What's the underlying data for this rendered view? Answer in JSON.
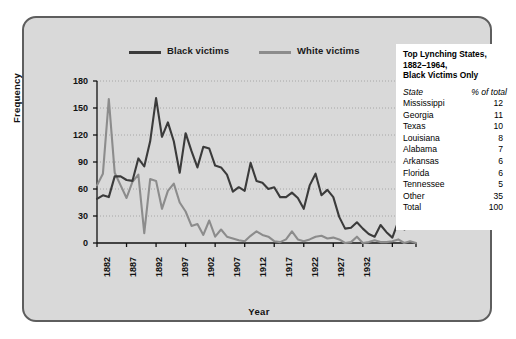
{
  "chart_data": {
    "type": "line",
    "title": "",
    "xlabel": "Year",
    "ylabel": "Frequency",
    "xlim": [
      1882,
      1936
    ],
    "ylim": [
      0,
      180
    ],
    "yticks": [
      0,
      30,
      60,
      90,
      120,
      150,
      180
    ],
    "xticks": [
      1882,
      1887,
      1892,
      1897,
      1902,
      1907,
      1912,
      1917,
      1922,
      1927,
      1932
    ],
    "grid": "horizontal-dotted",
    "legend_position": "top",
    "x": [
      1882,
      1883,
      1884,
      1885,
      1886,
      1887,
      1888,
      1889,
      1890,
      1891,
      1892,
      1893,
      1894,
      1895,
      1896,
      1897,
      1898,
      1899,
      1900,
      1901,
      1902,
      1903,
      1904,
      1905,
      1906,
      1907,
      1908,
      1909,
      1910,
      1911,
      1912,
      1913,
      1914,
      1915,
      1916,
      1917,
      1918,
      1919,
      1920,
      1921,
      1922,
      1923,
      1924,
      1925,
      1926,
      1927,
      1928,
      1929,
      1930,
      1931,
      1932,
      1933,
      1934,
      1935,
      1936
    ],
    "series": [
      {
        "name": "Black victims",
        "color": "#3b3b3b",
        "values": [
          49,
          53,
          51,
          74,
          74,
          70,
          69,
          94,
          85,
          113,
          161,
          118,
          134,
          113,
          78,
          122,
          102,
          84,
          107,
          105,
          86,
          84,
          76,
          57,
          62,
          58,
          89,
          69,
          67,
          60,
          62,
          51,
          51,
          56,
          50,
          38,
          64,
          77,
          53,
          59,
          51,
          29,
          16,
          17,
          23,
          16,
          10,
          7,
          20,
          12,
          6,
          24,
          15,
          18,
          18
        ]
      },
      {
        "name": "White victims",
        "color": "#8c8c8c",
        "values": [
          64,
          77,
          160,
          78,
          64,
          50,
          68,
          76,
          11,
          71,
          69,
          38,
          58,
          66,
          45,
          35,
          19,
          21,
          9,
          25,
          7,
          15,
          7,
          5,
          3,
          2,
          8,
          13,
          9,
          7,
          2,
          1,
          4,
          13,
          4,
          2,
          4,
          7,
          8,
          5,
          6,
          4,
          0,
          1,
          7,
          0,
          1,
          3,
          1,
          1,
          2,
          4,
          0,
          2,
          0
        ]
      }
    ]
  },
  "legend": {
    "items": [
      {
        "label": "Black victims",
        "color": "#3b3b3b"
      },
      {
        "label": "White victims",
        "color": "#8c8c8c"
      }
    ]
  },
  "axes": {
    "ylabel": "Frequency",
    "xlabel": "Year",
    "yticks": [
      "180",
      "150",
      "120",
      "90",
      "60",
      "30",
      "0"
    ],
    "xticks": [
      "1882",
      "1887",
      "1892",
      "1897",
      "1902",
      "1907",
      "1912",
      "1917",
      "1922",
      "1927",
      "1932"
    ]
  },
  "infobox": {
    "title": "Top Lynching States, 1882–1964, Black Victims Only",
    "title_lines": [
      "Top Lynching States,",
      "1882–1964,",
      "Black Victims Only"
    ],
    "header": {
      "state": "State",
      "pct": "% of total"
    },
    "rows": [
      {
        "state": "Mississippi",
        "pct": "12"
      },
      {
        "state": "Georgia",
        "pct": "11"
      },
      {
        "state": "Texas",
        "pct": "10"
      },
      {
        "state": "Louisiana",
        "pct": "8"
      },
      {
        "state": "Alabama",
        "pct": "7"
      },
      {
        "state": "Arkansas",
        "pct": "6"
      },
      {
        "state": "Florida",
        "pct": "6"
      },
      {
        "state": "Tennessee",
        "pct": "5"
      },
      {
        "state": "Other",
        "pct": "35"
      },
      {
        "state": "Total",
        "pct": "100"
      }
    ]
  }
}
